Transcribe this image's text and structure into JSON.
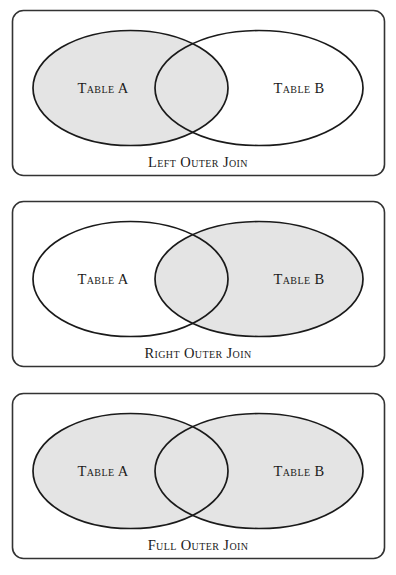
{
  "figure": {
    "type": "venn-diagram-set",
    "background_color": "#ffffff",
    "panel_border_color": "#333333",
    "ellipse_stroke_color": "#1a1a1a",
    "shaded_fill_color": "#e4e4e4",
    "unshaded_fill_color": "#ffffff",
    "text_color": "#1b1b1b"
  },
  "panels": [
    {
      "id": "left-outer-join",
      "caption": "Left Outer  Join",
      "left_label": "Table A",
      "right_label": "Table B",
      "shaded_regions": [
        "left-only",
        "intersection"
      ],
      "left_shaded": true,
      "right_shaded": false,
      "intersection_shaded": true
    },
    {
      "id": "right-outer-join",
      "caption": "Right Outer  Join",
      "left_label": "Table A",
      "right_label": "Table B",
      "shaded_regions": [
        "intersection",
        "right-only"
      ],
      "left_shaded": false,
      "right_shaded": true,
      "intersection_shaded": true
    },
    {
      "id": "full-outer-join",
      "caption": "Full Outer  Join",
      "left_label": "Table A",
      "right_label": "Table B",
      "shaded_regions": [
        "left-only",
        "intersection",
        "right-only"
      ],
      "left_shaded": true,
      "right_shaded": true,
      "intersection_shaded": true
    }
  ]
}
